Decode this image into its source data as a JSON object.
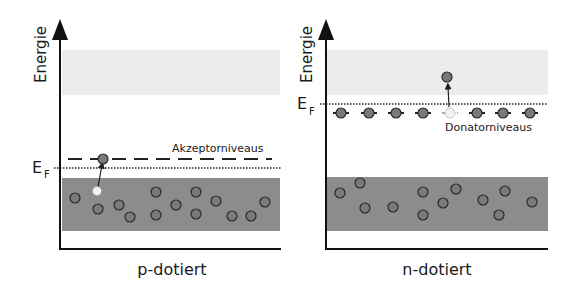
{
  "colors": {
    "conduction_band": "#ececec",
    "valence_band": "#8c8c8c",
    "electron_fill": "#7a7a7a",
    "electron_stroke": "#2a2a2a",
    "hole_fill": "#f2f2f2",
    "axis": "#111111"
  },
  "panels": [
    {
      "id": "p",
      "axis_label": "Energie",
      "fermi_label": "E",
      "fermi_sub": "F",
      "title": "p-dotiert",
      "level_label": "Akzeptorniveaus",
      "level_type": "acceptor"
    },
    {
      "id": "n",
      "axis_label": "Energie",
      "fermi_label": "E",
      "fermi_sub": "F",
      "title": "n-dotiert",
      "level_label": "Donatorniveaus",
      "level_type": "donor"
    }
  ]
}
